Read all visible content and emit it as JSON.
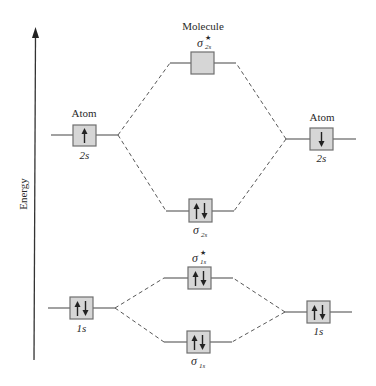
{
  "diagram": {
    "axis": {
      "label": "Energy",
      "direction": "up"
    },
    "headers": {
      "left_atom": "Atom",
      "molecule": "Molecule",
      "right_atom": "Atom"
    },
    "orbitals": [
      {
        "id": "left-2s",
        "column": "left-atom",
        "label": "2s",
        "label_pos": "below",
        "electrons": [
          "up"
        ]
      },
      {
        "id": "sigma-star-2s",
        "column": "molecule",
        "label": "σ",
        "sub": "2s",
        "star": true,
        "label_pos": "above",
        "electrons": []
      },
      {
        "id": "right-2s",
        "column": "right-atom",
        "label": "2s",
        "label_pos": "below",
        "electrons": [
          "down"
        ]
      },
      {
        "id": "sigma-2s",
        "column": "molecule",
        "label": "σ",
        "sub": "2s",
        "star": false,
        "label_pos": "below",
        "electrons": [
          "up",
          "down"
        ]
      },
      {
        "id": "sigma-star-1s",
        "column": "molecule",
        "label": "σ",
        "sub": "1s",
        "star": true,
        "label_pos": "above",
        "electrons": [
          "up",
          "down"
        ]
      },
      {
        "id": "left-1s",
        "column": "left-atom",
        "label": "1s",
        "label_pos": "below",
        "electrons": [
          "up",
          "down"
        ]
      },
      {
        "id": "right-1s",
        "column": "right-atom",
        "label": "1s",
        "label_pos": "below",
        "electrons": [
          "up",
          "down"
        ]
      },
      {
        "id": "sigma-1s",
        "column": "molecule",
        "label": "σ",
        "sub": "1s",
        "star": false,
        "label_pos": "below",
        "electrons": [
          "up",
          "down"
        ]
      }
    ],
    "labels": {
      "left_2s": "2s",
      "right_2s": "2s",
      "left_1s": "1s",
      "right_1s": "1s",
      "sigma": "σ",
      "star": "★",
      "sub_2s": "2s",
      "sub_1s": "1s"
    },
    "colors": {
      "box_fill": "#d6d6d6",
      "box_stroke": "#6e6e6e",
      "line": "#555555"
    }
  }
}
